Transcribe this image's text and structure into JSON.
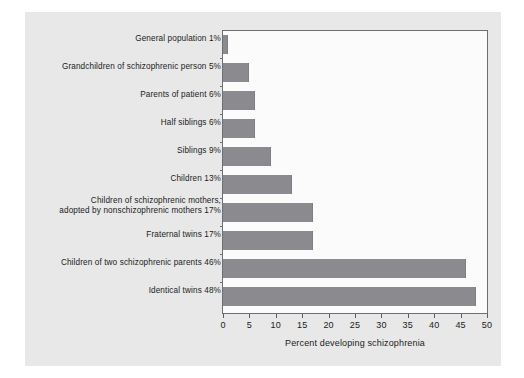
{
  "chart_data": {
    "type": "bar",
    "orientation": "horizontal",
    "title": "",
    "xlabel": "Percent developing schizophrenia",
    "ylabel": "",
    "xlim": [
      0,
      50
    ],
    "xticks": [
      0,
      5,
      10,
      15,
      20,
      25,
      30,
      35,
      40,
      45,
      50
    ],
    "xticklabels": [
      "0",
      "5",
      "10",
      "15",
      "20",
      "25",
      "30",
      "35",
      "40",
      "45",
      "50"
    ],
    "grid": false,
    "legend": null,
    "bar_color": "#8b8b8f",
    "plot_background": "#fbfbfb",
    "figure_background": "#e8e8e8",
    "categories": [
      "General population 1%",
      "Grandchildren of schizophrenic person 5%",
      "Parents of patient 6%",
      "Half siblings 6%",
      "Siblings 9%",
      "Children 13%",
      "Children of schizophrenic mothers,\nadopted by nonschizophrenic mothers 17%",
      "Fraternal twins 17%",
      "Children of two schizophrenic parents 46%",
      "Identical twins 48%"
    ],
    "values": [
      1,
      5,
      6,
      6,
      9,
      13,
      17,
      17,
      46,
      48
    ],
    "data_labels": [
      "1%",
      "5%",
      "6%",
      "6%",
      "9%",
      "13%",
      "17%",
      "17%",
      "46%",
      "48%"
    ]
  }
}
